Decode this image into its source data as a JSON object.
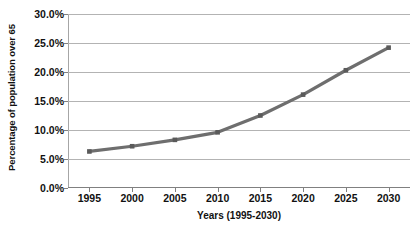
{
  "chart_data": {
    "type": "line",
    "title": "",
    "xlabel": "Years (1995-2030)",
    "ylabel": "Percentage of population over 65",
    "categories": [
      "1995",
      "2000",
      "2005",
      "2010",
      "2015",
      "2020",
      "2025",
      "2030"
    ],
    "x": [
      1995,
      2000,
      2005,
      2010,
      2015,
      2020,
      2025,
      2030
    ],
    "values": [
      6.3,
      7.2,
      8.3,
      9.6,
      12.5,
      16.1,
      20.3,
      24.2
    ],
    "series": [
      {
        "name": "Percentage of population over 65",
        "values": [
          6.3,
          7.2,
          8.3,
          9.6,
          12.5,
          16.1,
          20.3,
          24.2
        ]
      }
    ],
    "ylim": [
      0,
      30
    ],
    "xlim": [
      1992.5,
      2032.5
    ],
    "y_ticks": [
      0,
      5,
      10,
      15,
      20,
      25,
      30
    ],
    "y_tick_labels": [
      "0.0%",
      "5.0%",
      "10.0%",
      "15.0%",
      "20.0%",
      "25.0%",
      "30.0%"
    ],
    "x_tick_labels": [
      "1995",
      "2000",
      "2005",
      "2010",
      "2015",
      "2020",
      "2025",
      "2030"
    ],
    "grid": "horizontal",
    "legend": "none",
    "marker": "square",
    "line_color": "#6e6e6e",
    "marker_color": "#5a5a5a",
    "gridline_color": "#b3b3b3",
    "axis_color": "#808080",
    "background_color": "#ffffff"
  },
  "axes": {
    "y_title": "Percentage of population over 65",
    "x_title": "Years (1995-2030)"
  },
  "title_clipped": ""
}
